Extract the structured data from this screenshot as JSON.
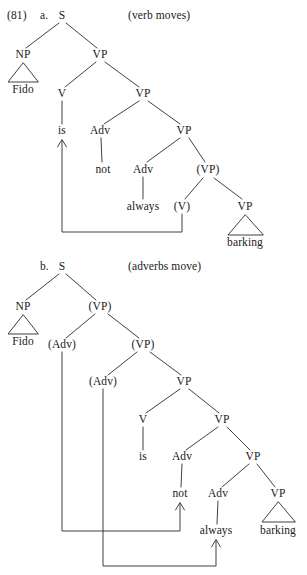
{
  "figure": {
    "example_number": "(81)",
    "trees": [
      {
        "id": "tree-a",
        "letter": "a.",
        "caption": "(verb moves)",
        "root": "S",
        "nodes": [
          {
            "name": "node-s",
            "text": "S",
            "x": 62,
            "y": 16
          },
          {
            "name": "node-np",
            "text": "NP",
            "x": 23,
            "y": 55
          },
          {
            "name": "node-vp-1",
            "text": "VP",
            "x": 100,
            "y": 55
          },
          {
            "name": "leaf-fido",
            "text": "Fido",
            "x": 23,
            "y": 90
          },
          {
            "name": "node-v",
            "text": "V",
            "x": 62,
            "y": 94
          },
          {
            "name": "node-vp-2",
            "text": "VP",
            "x": 143,
            "y": 94
          },
          {
            "name": "leaf-is",
            "text": "is",
            "x": 62,
            "y": 131
          },
          {
            "name": "node-adv-1",
            "text": "Adv",
            "x": 100,
            "y": 131
          },
          {
            "name": "node-vp-3",
            "text": "VP",
            "x": 184,
            "y": 131
          },
          {
            "name": "leaf-not",
            "text": "not",
            "x": 103,
            "y": 170
          },
          {
            "name": "node-adv-2",
            "text": "Adv",
            "x": 143,
            "y": 170
          },
          {
            "name": "node-vp-trace",
            "text": "(VP)",
            "x": 208,
            "y": 170
          },
          {
            "name": "leaf-always",
            "text": "always",
            "x": 143,
            "y": 207
          },
          {
            "name": "node-v-trace",
            "text": "(V)",
            "x": 182,
            "y": 207
          },
          {
            "name": "node-vp-4",
            "text": "VP",
            "x": 245,
            "y": 207
          },
          {
            "name": "leaf-barking",
            "text": "barking",
            "x": 245,
            "y": 243
          }
        ]
      },
      {
        "id": "tree-b",
        "letter": "b.",
        "caption": "(adverbs move)",
        "root": "S",
        "nodes": [
          {
            "name": "node-s",
            "text": "S",
            "x": 62,
            "y": 267
          },
          {
            "name": "node-np",
            "text": "NP",
            "x": 23,
            "y": 307
          },
          {
            "name": "node-vp-trace-1",
            "text": "(VP)",
            "x": 100,
            "y": 307
          },
          {
            "name": "leaf-fido",
            "text": "Fido",
            "x": 23,
            "y": 342
          },
          {
            "name": "node-adv-trace-1",
            "text": "(Adv)",
            "x": 62,
            "y": 345
          },
          {
            "name": "node-vp-trace-2",
            "text": "(VP)",
            "x": 143,
            "y": 345
          },
          {
            "name": "node-adv-trace-2",
            "text": "(Adv)",
            "x": 103,
            "y": 382
          },
          {
            "name": "node-vp-1",
            "text": "VP",
            "x": 184,
            "y": 382
          },
          {
            "name": "node-v",
            "text": "V",
            "x": 143,
            "y": 420
          },
          {
            "name": "node-vp-2",
            "text": "VP",
            "x": 222,
            "y": 420
          },
          {
            "name": "leaf-is",
            "text": "is",
            "x": 143,
            "y": 457
          },
          {
            "name": "node-adv-1",
            "text": "Adv",
            "x": 182,
            "y": 457
          },
          {
            "name": "node-vp-3",
            "text": "VP",
            "x": 253,
            "y": 457
          },
          {
            "name": "leaf-not",
            "text": "not",
            "x": 180,
            "y": 494
          },
          {
            "name": "node-adv-2",
            "text": "Adv",
            "x": 218,
            "y": 494
          },
          {
            "name": "node-vp-4",
            "text": "VP",
            "x": 278,
            "y": 494
          },
          {
            "name": "leaf-always",
            "text": "always",
            "x": 216,
            "y": 531
          },
          {
            "name": "leaf-barking",
            "text": "barking",
            "x": 278,
            "y": 531
          }
        ]
      }
    ],
    "movements": [
      {
        "name": "movement-arrow-verb",
        "from": "(V)",
        "to": "is"
      },
      {
        "name": "movement-arrow-adverb-1",
        "from": "(Adv)",
        "to": "not"
      },
      {
        "name": "movement-arrow-adverb-2",
        "from": "(Adv)",
        "to": "always"
      }
    ]
  }
}
